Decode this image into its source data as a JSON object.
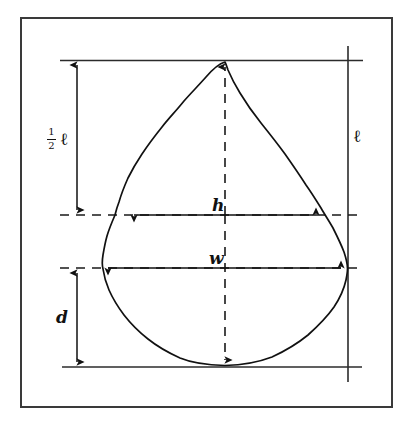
{
  "figure": {
    "background_color": "#ffffff",
    "line_color": "#111111",
    "frame": {
      "name": "outer-frame",
      "x": 20,
      "y": 17,
      "width": 373,
      "height": 391,
      "stroke": "#333333",
      "stroke_width": 2
    },
    "labels": {
      "half_length_numerator": "1",
      "half_length_denominator": "2",
      "half_length_symbol": "ℓ",
      "length_symbol": "ℓ",
      "width_at_half_length": "h",
      "max_width": "w",
      "depth": "d"
    },
    "dimensions": [
      {
        "name": "half-length",
        "label": "½ ℓ",
        "orientation": "vertical",
        "from": [
          77,
          60
        ],
        "to": [
          77,
          215
        ],
        "arrowheads": "both"
      },
      {
        "name": "depth",
        "label": "d",
        "orientation": "vertical",
        "from": [
          77,
          268
        ],
        "to": [
          77,
          367
        ],
        "arrowheads": "both"
      },
      {
        "name": "total-length",
        "label": "ℓ",
        "orientation": "vertical",
        "from": [
          348,
          46
        ],
        "to": [
          348,
          382
        ],
        "arrowheads": "none"
      },
      {
        "name": "width-at-half-length",
        "label": "h",
        "orientation": "horizontal",
        "from": [
          129,
          215
        ],
        "to": [
          320,
          215
        ],
        "arrowheads": "both"
      },
      {
        "name": "max-width",
        "label": "w",
        "orientation": "horizontal",
        "from": [
          103,
          268
        ],
        "to": [
          345,
          268
        ],
        "arrowheads": "both"
      },
      {
        "name": "vertical-axis",
        "label": "",
        "orientation": "vertical-dashed",
        "from": [
          225,
          62
        ],
        "to": [
          225,
          365
        ],
        "arrowheads": "both"
      }
    ],
    "guide_lines": [
      {
        "name": "top-reference-line",
        "style": "solid",
        "x1": 60,
        "y1": 60,
        "x2": 363,
        "y2": 60
      },
      {
        "name": "bottom-reference-line",
        "style": "solid",
        "x1": 62,
        "y1": 367,
        "x2": 362,
        "y2": 367
      },
      {
        "name": "half-length-reference-line",
        "style": "dashed",
        "x1": 60,
        "y1": 215,
        "x2": 361,
        "y2": 215
      },
      {
        "name": "max-width-reference-line",
        "style": "dashed",
        "x1": 60,
        "y1": 268,
        "x2": 361,
        "y2": 268
      }
    ],
    "outline": {
      "name": "specimen-outline",
      "apex": [
        225,
        62
      ],
      "base": [
        225,
        365
      ],
      "widest_left": [
        103,
        268
      ],
      "widest_right": [
        345,
        268
      ],
      "half_length_left": [
        129,
        215
      ],
      "half_length_right": [
        320,
        215
      ],
      "stroke_width": 1.6
    }
  }
}
